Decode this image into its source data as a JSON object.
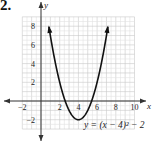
{
  "problem_number": "2.",
  "chart_data": {
    "type": "line",
    "title": "",
    "equation_label": "y = (x − 4)² − 2",
    "xlabel": "x",
    "ylabel": "y",
    "xlim": [
      -2,
      11
    ],
    "ylim": [
      -4,
      9.5
    ],
    "grid": true,
    "x_ticks": [
      -2,
      2,
      4,
      6,
      8,
      10
    ],
    "y_ticks": [
      -2,
      2,
      4,
      6,
      8
    ],
    "x_tick_labels": [
      "−2",
      "2",
      "4",
      "6",
      "8",
      "10"
    ],
    "y_tick_labels": [
      "−2",
      "2",
      "4",
      "6",
      "8"
    ],
    "series": [
      {
        "name": "y = (x − 4)² − 2",
        "function": "(x-4)^2-2",
        "x": [
          1.0,
          1.5,
          2.0,
          2.5,
          3.0,
          3.5,
          4.0,
          4.5,
          5.0,
          5.5,
          6.0,
          6.5,
          7.0
        ],
        "values": [
          7.0,
          4.25,
          2.0,
          0.25,
          -1.0,
          -1.75,
          -2.0,
          -1.75,
          -1.0,
          0.25,
          2.0,
          4.25,
          7.0
        ],
        "vertex": [
          4,
          -2
        ],
        "color": "#111111"
      }
    ]
  }
}
